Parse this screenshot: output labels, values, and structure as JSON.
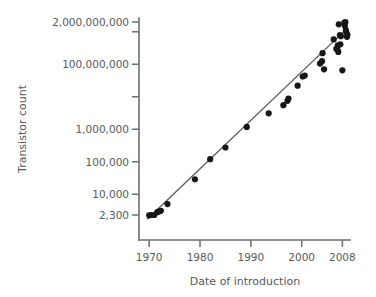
{
  "chart_data": {
    "type": "scatter",
    "title": "",
    "xlabel": "Date of introduction",
    "ylabel": "Transistor count",
    "yscale": "log",
    "xlim": [
      1968.0,
      2009.5
    ],
    "ylim": [
      2300,
      2000000000
    ],
    "grid": false,
    "legend": null,
    "ytick_labels": [
      "2,000,000,000",
      "100,000,000",
      "1,000,000",
      "100,000",
      "10,000",
      "2,300"
    ],
    "ytick_values": [
      2000000000,
      100000000,
      1000000,
      100000,
      10000,
      2300
    ],
    "ytick_unlabeled_values": [
      1000000000,
      10000000
    ],
    "xtick_labels": [
      "1970",
      "1980",
      "1990",
      "2000",
      "2008"
    ],
    "xtick_values": [
      1970,
      1980,
      1990,
      2000,
      2008
    ],
    "series": [
      {
        "name": "Transistor count",
        "marker": "filled-circle",
        "color": "#161616",
        "points": [
          {
            "x": 1970.0,
            "y": 2250
          },
          {
            "x": 1970.4,
            "y": 2300
          },
          {
            "x": 1971.0,
            "y": 2300
          },
          {
            "x": 1971.6,
            "y": 2800
          },
          {
            "x": 1972.0,
            "y": 3000
          },
          {
            "x": 1972.3,
            "y": 3100
          },
          {
            "x": 1973.6,
            "y": 5000
          },
          {
            "x": 1979.0,
            "y": 29000
          },
          {
            "x": 1982.0,
            "y": 120000
          },
          {
            "x": 1985.0,
            "y": 275000
          },
          {
            "x": 1989.2,
            "y": 1180000
          },
          {
            "x": 1993.5,
            "y": 3100000
          },
          {
            "x": 1996.4,
            "y": 5500000
          },
          {
            "x": 1997.2,
            "y": 7500000
          },
          {
            "x": 1997.4,
            "y": 8800000
          },
          {
            "x": 1999.2,
            "y": 22000000
          },
          {
            "x": 2000.2,
            "y": 42000000
          },
          {
            "x": 2000.6,
            "y": 45000000
          },
          {
            "x": 2003.6,
            "y": 105000000
          },
          {
            "x": 2004.0,
            "y": 125000000
          },
          {
            "x": 2004.1,
            "y": 220000000
          },
          {
            "x": 2004.4,
            "y": 70000000
          },
          {
            "x": 2006.3,
            "y": 580000000
          },
          {
            "x": 2006.8,
            "y": 300000000
          },
          {
            "x": 2007.0,
            "y": 290000000
          },
          {
            "x": 2007.1,
            "y": 380000000
          },
          {
            "x": 2007.2,
            "y": 240000000
          },
          {
            "x": 2007.3,
            "y": 1700000000
          },
          {
            "x": 2007.5,
            "y": 790000000
          },
          {
            "x": 2007.6,
            "y": 410000000
          },
          {
            "x": 2007.7,
            "y": 730000000
          },
          {
            "x": 2008.0,
            "y": 65000000
          },
          {
            "x": 2008.4,
            "y": 1900000000
          },
          {
            "x": 2008.5,
            "y": 1500000000
          },
          {
            "x": 2008.6,
            "y": 2000000000
          },
          {
            "x": 2008.7,
            "y": 1100000000
          },
          {
            "x": 2008.8,
            "y": 920000000
          },
          {
            "x": 2008.9,
            "y": 700000000
          },
          {
            "x": 2009.0,
            "y": 810000000
          }
        ]
      }
    ],
    "trendline": {
      "name": "Moore's law fit",
      "color": "#58595b",
      "x_start": 1969.6,
      "y_start": 1700,
      "x_end": 2008.9,
      "y_end": 1250000000
    }
  }
}
